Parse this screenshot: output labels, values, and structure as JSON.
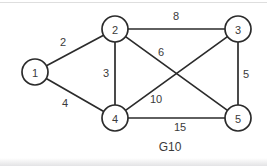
{
  "diagram": {
    "caption": "G10",
    "caption_pos": {
      "x": 170,
      "y": 147
    },
    "colors": {
      "stroke": "#2b2b2b",
      "text": "#3a3a3a",
      "background": "#ffffff"
    },
    "node_radius": 13,
    "nodes": [
      {
        "id": "1",
        "label": "1",
        "x": 35,
        "y": 72
      },
      {
        "id": "2",
        "label": "2",
        "x": 115,
        "y": 29
      },
      {
        "id": "3",
        "label": "3",
        "x": 238,
        "y": 29
      },
      {
        "id": "4",
        "label": "4",
        "x": 115,
        "y": 118
      },
      {
        "id": "5",
        "label": "5",
        "x": 238,
        "y": 118
      }
    ],
    "edges": [
      {
        "from": "1",
        "to": "2",
        "weight": "2",
        "label_x": 63,
        "label_y": 42
      },
      {
        "from": "1",
        "to": "4",
        "weight": "4",
        "label_x": 65,
        "label_y": 103
      },
      {
        "from": "2",
        "to": "3",
        "weight": "8",
        "label_x": 176,
        "label_y": 16
      },
      {
        "from": "2",
        "to": "4",
        "weight": "3",
        "label_x": 106,
        "label_y": 73
      },
      {
        "from": "2",
        "to": "5",
        "weight": "6",
        "label_x": 161,
        "label_y": 52
      },
      {
        "from": "3",
        "to": "5",
        "weight": "5",
        "label_x": 246,
        "label_y": 74
      },
      {
        "from": "4",
        "to": "3",
        "weight": "10",
        "label_x": 156,
        "label_y": 99
      },
      {
        "from": "4",
        "to": "5",
        "weight": "15",
        "label_x": 180,
        "label_y": 127
      }
    ]
  }
}
